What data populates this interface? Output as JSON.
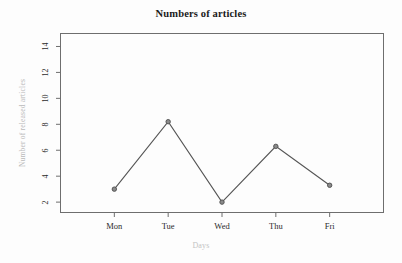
{
  "chart_data": {
    "type": "line",
    "title": "Numbers of articles",
    "xlabel": "Days",
    "ylabel": "Number of released articles",
    "categories": [
      "Mon",
      "Tue",
      "Wed",
      "Thu",
      "Fri"
    ],
    "values": [
      3.0,
      8.2,
      2.0,
      6.3,
      3.3
    ],
    "series": [
      {
        "name": "Number of released articles",
        "values": [
          3.0,
          8.2,
          2.0,
          6.3,
          3.3
        ]
      }
    ],
    "y_ticks": [
      2,
      4,
      6,
      8,
      10,
      12,
      14
    ],
    "ylim": [
      1.2,
      15.0
    ],
    "xlim": [
      0,
      6
    ],
    "grid": false,
    "legend": null,
    "marker": "circle",
    "line_color": "#555555",
    "marker_color": "#555555",
    "frame_color": "#6e6e6e",
    "background_color": "#fdfdfd",
    "title_color": "#1a1a1a",
    "axis_title_color": "#bdbdbd",
    "tick_label_color": "#2b2b2b"
  },
  "axis": {
    "y_tick_labels": [
      "2",
      "4",
      "6",
      "8",
      "10",
      "12",
      "14"
    ],
    "x_tick_labels": [
      "Mon",
      "Tue",
      "Wed",
      "Thu",
      "Fri"
    ]
  }
}
